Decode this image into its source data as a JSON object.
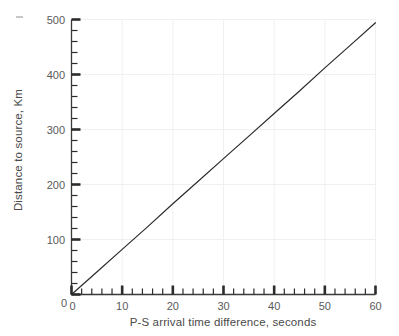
{
  "chart_data": {
    "type": "line",
    "title": "",
    "subtitle": "",
    "xlabel": "P-S arrival time difference, seconds",
    "ylabel": "Distance to source, Km",
    "xlim": [
      0,
      60
    ],
    "ylim": [
      0,
      500
    ],
    "xticks": [
      0,
      10,
      20,
      30,
      40,
      50,
      60
    ],
    "yticks": [
      0,
      100,
      200,
      300,
      400,
      500
    ],
    "xtick_labels": [
      "0",
      "10",
      "20",
      "30",
      "40",
      "50",
      "60"
    ],
    "ytick_labels": [
      "0",
      "100",
      "200",
      "300",
      "400",
      "500"
    ],
    "x_minor_tick_interval": 2,
    "y_minor_tick_interval": 20,
    "grid": true,
    "grid_color": "#f0f0f0",
    "legend": null,
    "legend_position": "none",
    "series": [
      {
        "name": "P-S time vs distance",
        "color": "#2b2b2b",
        "line_width": 1.2,
        "slope_km_per_second": 8.23,
        "intercept": 0,
        "x": [
          0,
          5,
          10,
          15,
          20,
          25,
          30,
          35,
          40,
          45,
          50,
          55,
          60
        ],
        "values": [
          0,
          41,
          82,
          123,
          165,
          206,
          247,
          288,
          329,
          370,
          412,
          453,
          494
        ]
      }
    ],
    "annotations": []
  },
  "axes": {
    "y_axis_label": "Distance to source, Km",
    "x_axis_label": "P-S arrival time difference, seconds",
    "tick_color": "#2b2b2b",
    "axis_color": "#3a3a3a"
  },
  "colors": {
    "background": "#ffffff",
    "line": "#2b2b2b",
    "grid": "#f0f0f0",
    "text": "#4a4a4a",
    "tick_text": "#5a5a5a"
  }
}
